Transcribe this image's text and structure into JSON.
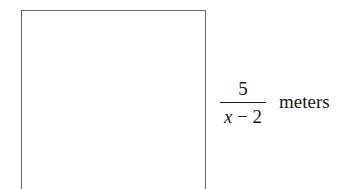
{
  "figure": {
    "shape": "rectangle",
    "side_label": {
      "numerator": "5",
      "denominator_variable": "x",
      "denominator_rest": " − 2",
      "unit": "meters"
    }
  }
}
